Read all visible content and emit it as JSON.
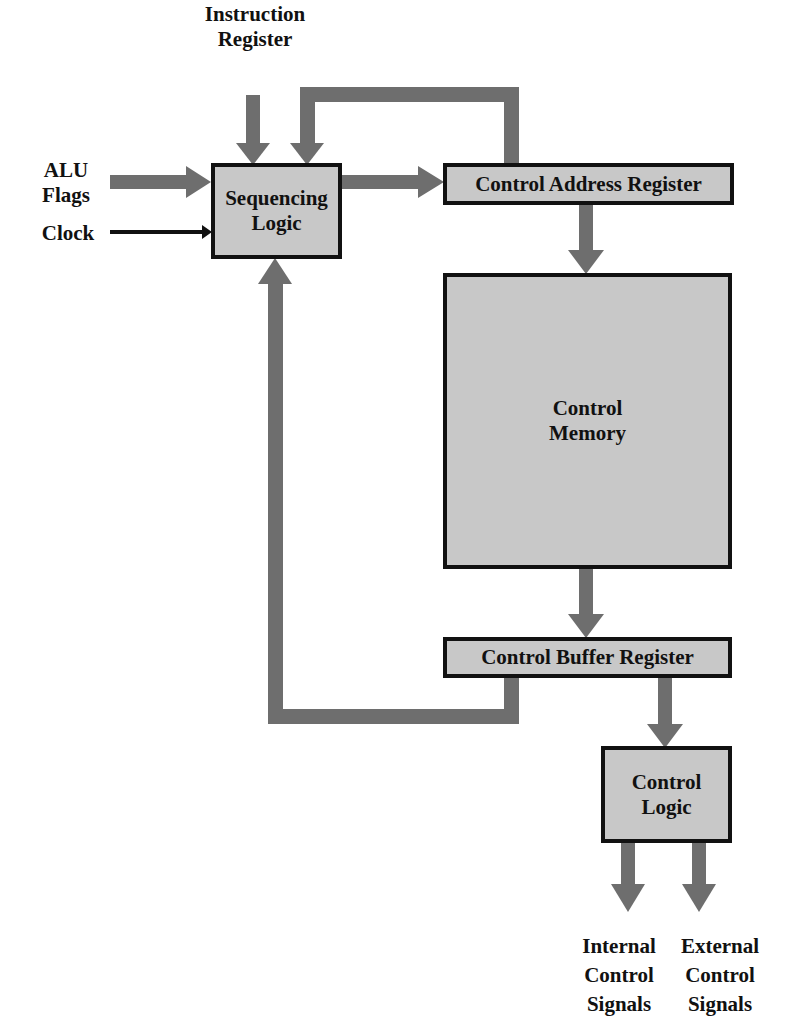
{
  "diagram": {
    "colors": {
      "arrow": "#6e6e6e",
      "box_fill": "#c8c8c8",
      "border": "#111111",
      "background": "#ffffff"
    },
    "inputs": {
      "instruction_register": [
        "Instruction",
        "Register"
      ],
      "alu_flags": [
        "ALU",
        "Flags"
      ],
      "clock": "Clock"
    },
    "blocks": {
      "sequencing_logic": [
        "Sequencing",
        "Logic"
      ],
      "control_address_register": "Control Address Register",
      "control_memory": [
        "Control",
        "Memory"
      ],
      "control_buffer_register": "Control Buffer Register",
      "control_logic": [
        "Control",
        "Logic"
      ]
    },
    "outputs": {
      "internal_control_signals": [
        "Internal",
        "Control",
        "Signals"
      ],
      "external_control_signals": [
        "External",
        "Control",
        "Signals"
      ]
    },
    "connections": [
      {
        "from": "Instruction Register",
        "to": "Sequencing Logic"
      },
      {
        "from": "ALU Flags",
        "to": "Sequencing Logic"
      },
      {
        "from": "Clock",
        "to": "Sequencing Logic"
      },
      {
        "from": "Sequencing Logic",
        "to": "Control Address Register"
      },
      {
        "from": "Control Address Register",
        "to": "Sequencing Logic"
      },
      {
        "from": "Control Address Register",
        "to": "Control Memory"
      },
      {
        "from": "Control Memory",
        "to": "Control Buffer Register"
      },
      {
        "from": "Control Buffer Register",
        "to": "Sequencing Logic"
      },
      {
        "from": "Control Buffer Register",
        "to": "Control Logic"
      },
      {
        "from": "Control Logic",
        "to": "Internal Control Signals"
      },
      {
        "from": "Control Logic",
        "to": "External Control Signals"
      }
    ]
  }
}
